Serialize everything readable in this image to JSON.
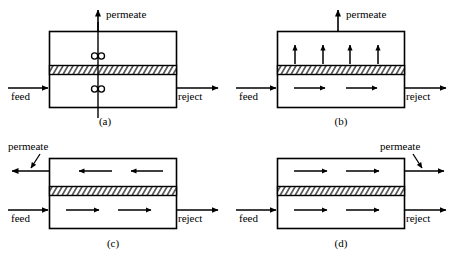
{
  "figure": {
    "line_color": "#000000",
    "background": "#ffffff",
    "membrane_fill": "#ffffff",
    "membrane_hatch_color": "#000000"
  },
  "labels": {
    "feed": "feed",
    "reject": "reject",
    "permeate": "permeate"
  },
  "panels": [
    {
      "id": "a",
      "caption": "(a)",
      "description": "complete mixing with stirrers",
      "feed": "feed",
      "reject": "reject",
      "permeate": "permeate",
      "stirrers": 2,
      "upper_arrows": 0,
      "lower_arrows": 0,
      "permeate_direction": "up",
      "permeate_exit": "top",
      "has_leader_arrow": false
    },
    {
      "id": "b",
      "caption": "(b)",
      "description": "cross-flow, permeate collected at top",
      "feed": "feed",
      "reject": "reject",
      "permeate": "permeate",
      "stirrers": 0,
      "upper_arrows": 4,
      "lower_arrows": 2,
      "permeate_direction": "up",
      "permeate_exit": "top",
      "has_leader_arrow": false
    },
    {
      "id": "c",
      "caption": "(c)",
      "description": "counter-current flow",
      "feed": "feed",
      "reject": "reject",
      "permeate": "permeate",
      "stirrers": 0,
      "upper_arrows": 2,
      "lower_arrows": 2,
      "permeate_direction": "left",
      "permeate_exit": "upper-left",
      "has_leader_arrow": true
    },
    {
      "id": "d",
      "caption": "(d)",
      "description": "co-current flow",
      "feed": "feed",
      "reject": "reject",
      "permeate": "permeate",
      "stirrers": 0,
      "upper_arrows": 2,
      "lower_arrows": 2,
      "permeate_direction": "right",
      "permeate_exit": "upper-right",
      "has_leader_arrow": true
    }
  ]
}
